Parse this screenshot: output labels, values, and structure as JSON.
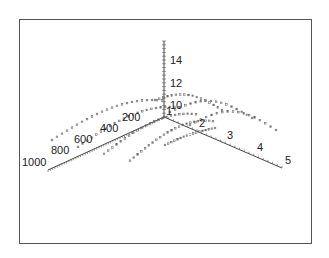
{
  "chart_data": {
    "type": "scatter",
    "title": "",
    "subtitle": "",
    "projection": "3d",
    "xlabel": "",
    "ylabel": "",
    "zlabel": "",
    "axes": {
      "left": {
        "range": [
          0,
          1000
        ],
        "ticks": [
          200,
          400,
          600,
          800,
          1000
        ]
      },
      "right": {
        "range": [
          0,
          5
        ],
        "ticks": [
          1,
          2,
          3,
          4,
          5
        ]
      },
      "vertical": {
        "range": [
          8,
          16
        ],
        "ticks": [
          10,
          12,
          14
        ]
      }
    },
    "legend": null,
    "grid": false,
    "series": [
      {
        "name": "arc-1",
        "right_value": 1,
        "description": "arc of points peaking near z≈10 spanning left axis 0–1000"
      },
      {
        "name": "arc-2",
        "right_value": 2,
        "description": "arc of points peaking near z≈10"
      },
      {
        "name": "arc-3",
        "right_value": 3,
        "description": "arc of points peaking near z≈10"
      },
      {
        "name": "arc-4",
        "right_value": 4,
        "description": "arc of points"
      }
    ]
  },
  "labels": {
    "left": [
      "200",
      "400",
      "600",
      "800",
      "1000"
    ],
    "right": [
      "1",
      "2",
      "3",
      "4",
      "5"
    ],
    "vertical": [
      "10",
      "12",
      "14"
    ]
  }
}
